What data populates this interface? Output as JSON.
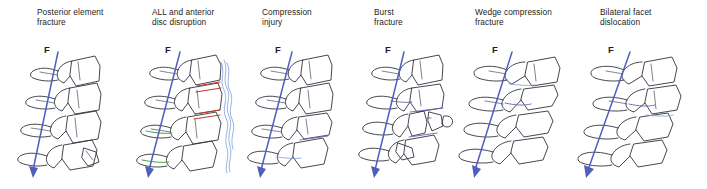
{
  "figure": {
    "name": "spinal-injury-mechanisms",
    "background_color": "#ffffff",
    "line_color": "#32323f",
    "arrow_color": "#4f5fbe",
    "force_symbol": "F"
  },
  "panels": [
    {
      "id": "posterior-element-fracture",
      "caption": "Posterior element\nfracture",
      "caption_x": 37,
      "force_label": "F",
      "force_label_x": 44,
      "force_label_y": 44,
      "arrow": {
        "x1": 58,
        "y1": 52,
        "x2": 30,
        "y2": 178
      },
      "annotations": []
    },
    {
      "id": "all-and-anterior-disc-disruption",
      "caption": "ALL and anterior\ndisc disruption",
      "caption_x": 152,
      "force_label": "F",
      "force_label_x": 165,
      "force_label_y": 44,
      "arrow": {
        "x1": 180,
        "y1": 52,
        "x2": 146,
        "y2": 178
      },
      "annotations": [
        "red-disc-disruption",
        "green-posterior-ligament",
        "blue-anterior-longitudinal-ligament"
      ]
    },
    {
      "id": "compression-injury",
      "caption": "Compression\ninjury",
      "caption_x": 262,
      "force_label": "F",
      "force_label_x": 275,
      "force_label_y": 44,
      "arrow": {
        "x1": 292,
        "y1": 52,
        "x2": 258,
        "y2": 178
      },
      "annotations": [
        "blue-endplate-compression"
      ]
    },
    {
      "id": "burst-fracture",
      "caption": "Burst\nfracture",
      "caption_x": 374,
      "force_label": "F",
      "force_label_x": 385,
      "force_label_y": 44,
      "arrow": {
        "x1": 404,
        "y1": 52,
        "x2": 372,
        "y2": 178
      },
      "annotations": [
        "retropulsed-fragment",
        "purple-fracture-line"
      ]
    },
    {
      "id": "wedge-compression-fracture",
      "caption": "Wedge compression\nfracture",
      "caption_x": 475,
      "force_label": "F",
      "force_label_x": 492,
      "force_label_y": 44,
      "arrow": {
        "x1": 512,
        "y1": 52,
        "x2": 472,
        "y2": 178
      },
      "annotations": [
        "purple-wedge-collapse",
        "blue-endplate-line"
      ]
    },
    {
      "id": "bilateral-facet-dislocation",
      "caption": "Bilateral facet\ndislocation",
      "caption_x": 600,
      "force_label": "F",
      "force_label_x": 608,
      "force_label_y": 44,
      "arrow": {
        "x1": 630,
        "y1": 52,
        "x2": 584,
        "y2": 178
      },
      "annotations": [
        "purple-facet-line",
        "blue-disc-line"
      ]
    }
  ]
}
